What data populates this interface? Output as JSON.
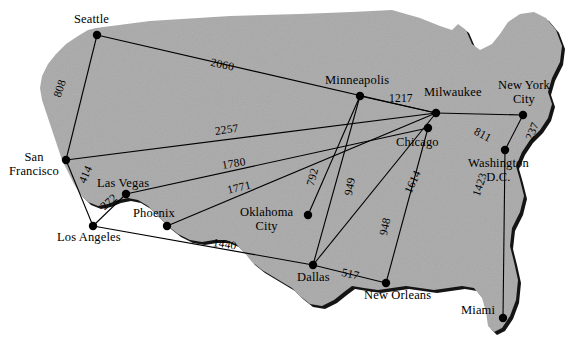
{
  "diagram": {
    "type": "geographic-graph",
    "colors": {
      "background": "#ffffff",
      "land_fill": "#a9a9a9",
      "land_shadow": "#141414",
      "edge_stroke": "#000000",
      "node_fill": "#000000",
      "label_text": "#000000"
    },
    "nodes": [
      {
        "id": "seattle",
        "label": "Seattle",
        "x": 97,
        "y": 35,
        "label_x": 74,
        "label_y": 13,
        "label_align": "left"
      },
      {
        "id": "san_francisco",
        "label": "San\nFrancisco",
        "x": 66,
        "y": 160,
        "label_x": 9,
        "label_y": 151,
        "label_align": "center"
      },
      {
        "id": "las_vegas",
        "label": "Las Vegas",
        "x": 126,
        "y": 194,
        "label_x": 97,
        "label_y": 177,
        "label_align": "left"
      },
      {
        "id": "los_angeles",
        "label": "Los Angeles",
        "x": 93,
        "y": 226,
        "label_x": 57,
        "label_y": 231,
        "label_align": "left"
      },
      {
        "id": "phoenix",
        "label": "Phoenix",
        "x": 167,
        "y": 226,
        "label_x": 133,
        "label_y": 207,
        "label_align": "left"
      },
      {
        "id": "minneapolis",
        "label": "Minneapolis",
        "x": 360,
        "y": 96,
        "label_x": 325,
        "label_y": 74,
        "label_align": "left"
      },
      {
        "id": "milwaukee",
        "label": "Milwaukee",
        "x": 436,
        "y": 113,
        "label_x": 424,
        "label_y": 86,
        "label_align": "left"
      },
      {
        "id": "chicago",
        "label": "Chicago",
        "x": 428,
        "y": 128,
        "label_x": 396,
        "label_y": 136,
        "label_align": "left"
      },
      {
        "id": "new_york_city",
        "label": "New York\nCity",
        "x": 523,
        "y": 115,
        "label_x": 498,
        "label_y": 79,
        "label_align": "center"
      },
      {
        "id": "washington_dc",
        "label": "Washington\nD.C.",
        "x": 505,
        "y": 150,
        "label_x": 468,
        "label_y": 157,
        "label_align": "center"
      },
      {
        "id": "oklahoma_city",
        "label": "Oklahoma\nCity",
        "x": 308,
        "y": 215,
        "label_x": 240,
        "label_y": 206,
        "label_align": "center"
      },
      {
        "id": "dallas",
        "label": "Dallas",
        "x": 313,
        "y": 265,
        "label_x": 297,
        "label_y": 271,
        "label_align": "left"
      },
      {
        "id": "new_orleans",
        "label": "New Orleans",
        "x": 386,
        "y": 283,
        "label_x": 364,
        "label_y": 289,
        "label_align": "left"
      },
      {
        "id": "miami",
        "label": "Miami",
        "x": 503,
        "y": 318,
        "label_x": 461,
        "label_y": 304,
        "label_align": "left"
      }
    ],
    "edges": [
      {
        "from": "seattle",
        "to": "san_francisco",
        "weight": "808",
        "label_x": 51,
        "label_y": 95,
        "rotate": -72
      },
      {
        "from": "seattle",
        "to": "milwaukee",
        "weight": "2060",
        "label_x": 212,
        "label_y": 56,
        "rotate": 12
      },
      {
        "from": "san_francisco",
        "to": "milwaukee",
        "weight": "2257",
        "label_x": 214,
        "label_y": 125,
        "rotate": -8
      },
      {
        "from": "san_francisco",
        "to": "los_angeles",
        "weight": "414",
        "label_x": 76,
        "label_y": 180,
        "rotate": -66
      },
      {
        "from": "las_vegas",
        "to": "los_angeles",
        "weight": "272",
        "label_x": 98,
        "label_y": 203,
        "rotate": -41
      },
      {
        "from": "las_vegas",
        "to": "chicago",
        "weight": "1780",
        "label_x": 221,
        "label_y": 159,
        "rotate": -9
      },
      {
        "from": "phoenix",
        "to": "milwaukee",
        "weight": "1771",
        "label_x": 226,
        "label_y": 184,
        "rotate": -13
      },
      {
        "from": "los_angeles",
        "to": "dallas",
        "weight": "1440",
        "label_x": 214,
        "label_y": 236,
        "rotate": 9
      },
      {
        "from": "minneapolis",
        "to": "milwaukee",
        "weight": "1217",
        "label_x": 389,
        "label_y": 92,
        "rotate": 0
      },
      {
        "from": "minneapolis",
        "to": "oklahoma_city",
        "weight": "792",
        "label_x": 304,
        "label_y": 184,
        "rotate": -75
      },
      {
        "from": "minneapolis",
        "to": "dallas",
        "weight": "949",
        "label_x": 342,
        "label_y": 194,
        "rotate": -79
      },
      {
        "from": "milwaukee",
        "to": "new_york_city",
        "weight": "811",
        "label_x": 478,
        "label_y": 125,
        "rotate": 28
      },
      {
        "from": "new_york_city",
        "to": "washington_dc",
        "weight": "237",
        "label_x": 523,
        "label_y": 137,
        "rotate": -68
      },
      {
        "from": "milwaukee",
        "to": "dallas",
        "weight": "1614",
        "label_x": 402,
        "label_y": 190,
        "rotate": -65
      },
      {
        "from": "chicago",
        "to": "new_orleans",
        "weight": "948",
        "label_x": 377,
        "label_y": 234,
        "rotate": -78
      },
      {
        "from": "washington_dc",
        "to": "miami",
        "weight": "1423",
        "label_x": 470,
        "label_y": 194,
        "rotate": -72
      },
      {
        "from": "dallas",
        "to": "new_orleans",
        "weight": "517",
        "label_x": 343,
        "label_y": 266,
        "rotate": 12
      }
    ]
  }
}
